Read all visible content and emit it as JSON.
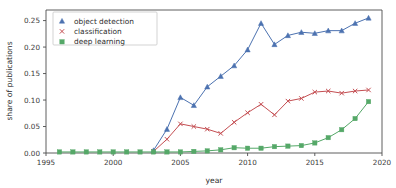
{
  "chart_data": {
    "type": "line",
    "title": "",
    "xlabel": "year",
    "ylabel": "share of publications",
    "xlim": [
      1995,
      2020
    ],
    "ylim": [
      0.0,
      0.27
    ],
    "xticks": [
      1995,
      2000,
      2005,
      2010,
      2015,
      2020
    ],
    "xtick_labels": [
      "1995",
      "2000",
      "2005",
      "2010",
      "2015",
      "2020"
    ],
    "yticks": [
      0.0,
      0.05,
      0.1,
      0.15,
      0.2,
      0.25
    ],
    "ytick_labels": [
      "0.00",
      "0.05",
      "0.10",
      "0.15",
      "0.20",
      "0.25"
    ],
    "grid": false,
    "legend_position": "upper left",
    "x": [
      1996,
      1997,
      1998,
      1999,
      2000,
      2001,
      2002,
      2003,
      2004,
      2005,
      2006,
      2007,
      2008,
      2009,
      2010,
      2011,
      2012,
      2013,
      2014,
      2015,
      2016,
      2017,
      2018,
      2019
    ],
    "series": [
      {
        "name": "object detection",
        "color": "#4C72B0",
        "marker": "triangle",
        "values": [
          null,
          null,
          null,
          null,
          null,
          null,
          null,
          0.005,
          0.045,
          0.105,
          0.09,
          0.125,
          0.145,
          0.165,
          0.195,
          0.245,
          0.205,
          0.222,
          0.228,
          0.226,
          0.231,
          0.231,
          0.245,
          0.255
        ]
      },
      {
        "name": "classification",
        "color": "#C44E52",
        "marker": "x",
        "values": [
          null,
          null,
          null,
          null,
          null,
          null,
          null,
          0.003,
          0.026,
          0.055,
          0.05,
          0.045,
          0.037,
          0.058,
          0.076,
          0.092,
          0.072,
          0.098,
          0.103,
          0.115,
          0.117,
          0.113,
          0.117,
          0.119
        ]
      },
      {
        "name": "deep learning",
        "color": "#55A868",
        "marker": "square",
        "values": [
          0.002,
          0.002,
          0.002,
          0.002,
          0.002,
          0.002,
          0.002,
          0.002,
          0.002,
          0.002,
          0.003,
          0.004,
          0.006,
          0.01,
          0.009,
          0.009,
          0.012,
          0.013,
          0.014,
          0.019,
          0.029,
          0.044,
          0.065,
          0.097
        ]
      }
    ]
  },
  "legend": {
    "entries": [
      {
        "label": "object detection"
      },
      {
        "label": "classification"
      },
      {
        "label": "deep learning"
      }
    ]
  }
}
